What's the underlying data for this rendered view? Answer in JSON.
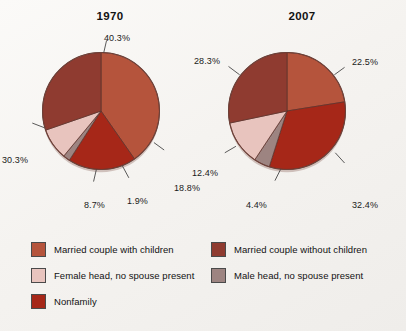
{
  "chart_data": [
    {
      "type": "pie",
      "title": "1970",
      "categories": [
        "Married couple with children",
        "Nonfamily",
        "Male head, no spouse present",
        "Female head, no spouse present",
        "Married couple without children"
      ],
      "values": [
        40.3,
        18.8,
        1.9,
        8.7,
        30.3
      ],
      "labels": [
        "40.3%",
        "18.8%",
        "1.9%",
        "8.7%",
        "30.3%"
      ],
      "colors": [
        "#b5543c",
        "#a62718",
        "#9d8481",
        "#e8c4be",
        "#8f3b30"
      ],
      "start_angle_deg": 0,
      "direction": "clockwise",
      "legend_position": "bottom"
    },
    {
      "type": "pie",
      "title": "2007",
      "categories": [
        "Married couple with children",
        "Nonfamily",
        "Male head, no spouse present",
        "Female head, no spouse present",
        "Married couple without children"
      ],
      "values": [
        22.5,
        32.4,
        4.4,
        12.4,
        28.3
      ],
      "labels": [
        "22.5%",
        "32.4%",
        "4.4%",
        "12.4%",
        "28.3%"
      ],
      "colors": [
        "#b5543c",
        "#a62718",
        "#9d8481",
        "#e8c4be",
        "#8f3b30"
      ],
      "start_angle_deg": 0,
      "direction": "clockwise",
      "legend_position": "bottom"
    }
  ],
  "charts": {
    "left": {
      "title": "1970",
      "labels": {
        "married_with_children": "40.3%",
        "nonfamily": "18.8%",
        "male_head": "1.9%",
        "female_head": "8.7%",
        "married_without_children": "30.3%"
      }
    },
    "right": {
      "title": "2007",
      "labels": {
        "married_with_children": "22.5%",
        "nonfamily": "32.4%",
        "male_head": "4.4%",
        "female_head": "12.4%",
        "married_without_children": "28.3%"
      }
    }
  },
  "legend": {
    "left_column": [
      {
        "label": "Married couple with children",
        "color": "#b5543c"
      },
      {
        "label": "Female head, no spouse present",
        "color": "#e8c4be"
      },
      {
        "label": "Nonfamily",
        "color": "#a62718"
      }
    ],
    "right_column": [
      {
        "label": "Married couple without children",
        "color": "#8f3b30"
      },
      {
        "label": "Male head, no spouse present",
        "color": "#9d8481"
      }
    ]
  }
}
